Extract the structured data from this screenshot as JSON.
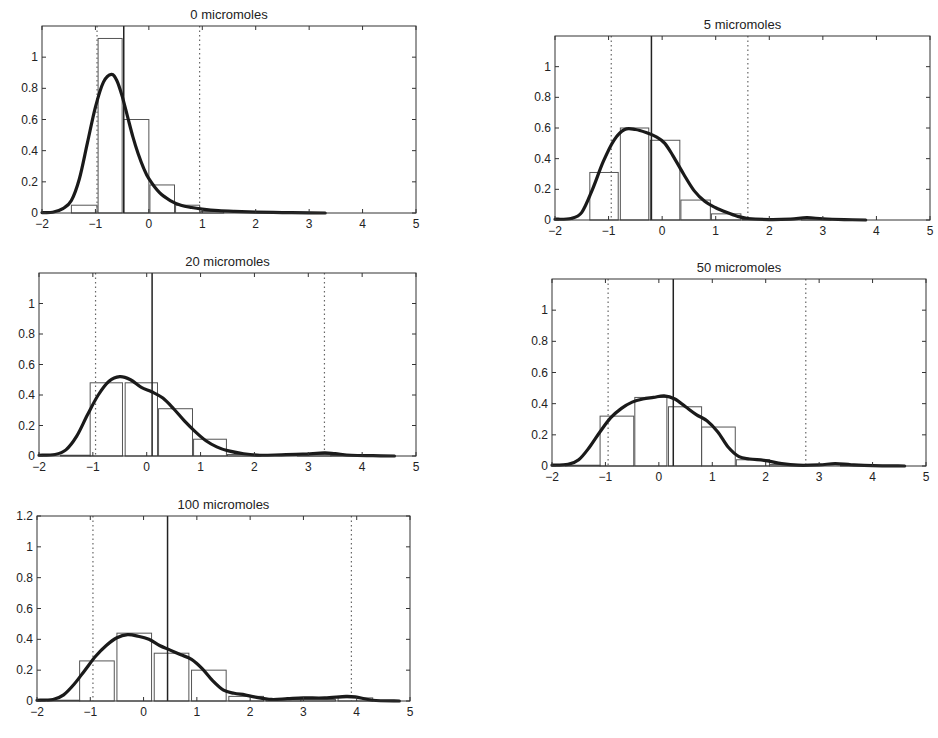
{
  "chart_data": [
    {
      "type": "bar",
      "title": "0 micromoles",
      "xlabel": "",
      "ylabel": "",
      "xlim": [
        -2,
        5
      ],
      "ylim": [
        0,
        1.2
      ],
      "xticks": [
        -2,
        -1,
        0,
        1,
        2,
        3,
        4,
        5
      ],
      "yticks": [
        0,
        0.2,
        0.4,
        0.6,
        0.8,
        1
      ],
      "grid": false,
      "histogram": [
        {
          "x0": -1.45,
          "x1": -0.97,
          "h": 0.05
        },
        {
          "x0": -0.95,
          "x1": -0.5,
          "h": 1.12
        },
        {
          "x0": -0.47,
          "x1": 0.0,
          "h": 0.6
        },
        {
          "x0": 0.02,
          "x1": 0.48,
          "h": 0.18
        },
        {
          "x0": 0.5,
          "x1": 0.95,
          "h": 0.05
        },
        {
          "x0": 0.97,
          "x1": 1.4,
          "h": 0.01
        }
      ],
      "density": [
        [
          -2,
          0.003
        ],
        [
          -1.8,
          0.005
        ],
        [
          -1.6,
          0.03
        ],
        [
          -1.45,
          0.08
        ],
        [
          -1.3,
          0.22
        ],
        [
          -1.15,
          0.45
        ],
        [
          -1.0,
          0.68
        ],
        [
          -0.85,
          0.84
        ],
        [
          -0.7,
          0.89
        ],
        [
          -0.6,
          0.85
        ],
        [
          -0.5,
          0.75
        ],
        [
          -0.4,
          0.62
        ],
        [
          -0.3,
          0.49
        ],
        [
          -0.2,
          0.38
        ],
        [
          -0.1,
          0.29
        ],
        [
          0.0,
          0.22
        ],
        [
          0.2,
          0.13
        ],
        [
          0.4,
          0.08
        ],
        [
          0.6,
          0.05
        ],
        [
          0.8,
          0.035
        ],
        [
          1.0,
          0.025
        ],
        [
          1.3,
          0.015
        ],
        [
          1.6,
          0.01
        ],
        [
          2.0,
          0.006
        ],
        [
          2.5,
          0.003
        ],
        [
          3.0,
          0.001
        ],
        [
          3.3,
          0.0
        ]
      ],
      "median_line": -0.47,
      "dotted_lines": [
        -0.97,
        0.95
      ]
    },
    {
      "type": "bar",
      "title": "5 micromoles",
      "xlabel": "",
      "ylabel": "",
      "xlim": [
        -2,
        5
      ],
      "ylim": [
        0,
        1.2
      ],
      "xticks": [
        -2,
        -1,
        0,
        1,
        2,
        3,
        4,
        5
      ],
      "yticks": [
        0,
        0.2,
        0.4,
        0.6,
        0.8,
        1
      ],
      "grid": false,
      "histogram": [
        {
          "x0": -1.35,
          "x1": -0.82,
          "h": 0.31
        },
        {
          "x0": -0.78,
          "x1": -0.25,
          "h": 0.6
        },
        {
          "x0": -0.22,
          "x1": 0.33,
          "h": 0.52
        },
        {
          "x0": 0.35,
          "x1": 0.9,
          "h": 0.13
        },
        {
          "x0": 0.92,
          "x1": 1.47,
          "h": 0.04
        },
        {
          "x0": 1.5,
          "x1": 2.05,
          "h": 0.005
        },
        {
          "x0": 2.6,
          "x1": 3.15,
          "h": 0.01
        }
      ],
      "density": [
        [
          -2,
          0.005
        ],
        [
          -1.7,
          0.01
        ],
        [
          -1.5,
          0.05
        ],
        [
          -1.3,
          0.2
        ],
        [
          -1.1,
          0.38
        ],
        [
          -0.9,
          0.52
        ],
        [
          -0.7,
          0.59
        ],
        [
          -0.5,
          0.59
        ],
        [
          -0.3,
          0.57
        ],
        [
          -0.1,
          0.54
        ],
        [
          0.05,
          0.5
        ],
        [
          0.2,
          0.42
        ],
        [
          0.4,
          0.3
        ],
        [
          0.6,
          0.19
        ],
        [
          0.8,
          0.12
        ],
        [
          1.0,
          0.08
        ],
        [
          1.2,
          0.05
        ],
        [
          1.4,
          0.025
        ],
        [
          1.6,
          0.01
        ],
        [
          2.0,
          0.003
        ],
        [
          2.4,
          0.006
        ],
        [
          2.7,
          0.015
        ],
        [
          3.0,
          0.008
        ],
        [
          3.4,
          0.003
        ],
        [
          3.8,
          0.0
        ]
      ],
      "median_line": -0.2,
      "dotted_lines": [
        -0.95,
        1.6
      ]
    },
    {
      "type": "bar",
      "title": "20 micromoles",
      "xlabel": "",
      "ylabel": "",
      "xlim": [
        -2,
        5
      ],
      "ylim": [
        0,
        1.2
      ],
      "xticks": [
        -2,
        -1,
        0,
        1,
        2,
        3,
        4,
        5
      ],
      "yticks": [
        0,
        0.2,
        0.4,
        0.6,
        0.8,
        1
      ],
      "grid": false,
      "histogram": [
        {
          "x0": -1.6,
          "x1": -1.05,
          "h": 0.005
        },
        {
          "x0": -1.05,
          "x1": -0.45,
          "h": 0.48
        },
        {
          "x0": -0.4,
          "x1": 0.2,
          "h": 0.48
        },
        {
          "x0": 0.22,
          "x1": 0.85,
          "h": 0.31
        },
        {
          "x0": 0.87,
          "x1": 1.48,
          "h": 0.11
        },
        {
          "x0": 1.5,
          "x1": 2.12,
          "h": 0.01
        },
        {
          "x0": 2.8,
          "x1": 3.42,
          "h": 0.01
        },
        {
          "x0": 3.42,
          "x1": 4.0,
          "h": 0.005
        }
      ],
      "density": [
        [
          -2,
          0.005
        ],
        [
          -1.7,
          0.01
        ],
        [
          -1.5,
          0.04
        ],
        [
          -1.3,
          0.13
        ],
        [
          -1.1,
          0.27
        ],
        [
          -0.9,
          0.4
        ],
        [
          -0.7,
          0.49
        ],
        [
          -0.5,
          0.52
        ],
        [
          -0.3,
          0.5
        ],
        [
          -0.1,
          0.45
        ],
        [
          0.1,
          0.42
        ],
        [
          0.3,
          0.38
        ],
        [
          0.5,
          0.31
        ],
        [
          0.7,
          0.23
        ],
        [
          0.9,
          0.16
        ],
        [
          1.1,
          0.1
        ],
        [
          1.3,
          0.06
        ],
        [
          1.5,
          0.035
        ],
        [
          1.8,
          0.015
        ],
        [
          2.1,
          0.005
        ],
        [
          2.5,
          0.008
        ],
        [
          2.9,
          0.012
        ],
        [
          3.3,
          0.02
        ],
        [
          3.5,
          0.015
        ],
        [
          3.8,
          0.005
        ],
        [
          4.2,
          0.002
        ],
        [
          4.6,
          0.0
        ]
      ],
      "median_line": 0.1,
      "dotted_lines": [
        -0.95,
        3.3
      ]
    },
    {
      "type": "bar",
      "title": "50 micromoles",
      "xlabel": "",
      "ylabel": "",
      "xlim": [
        -2,
        5
      ],
      "ylim": [
        0,
        1.2
      ],
      "xticks": [
        -2,
        -1,
        0,
        1,
        2,
        3,
        4,
        5
      ],
      "yticks": [
        0,
        0.2,
        0.4,
        0.6,
        0.8,
        1
      ],
      "grid": false,
      "histogram": [
        {
          "x0": -1.75,
          "x1": -1.1,
          "h": 0.005
        },
        {
          "x0": -1.1,
          "x1": -0.47,
          "h": 0.32
        },
        {
          "x0": -0.45,
          "x1": 0.15,
          "h": 0.44
        },
        {
          "x0": 0.18,
          "x1": 0.8,
          "h": 0.38
        },
        {
          "x0": 0.8,
          "x1": 1.43,
          "h": 0.25
        },
        {
          "x0": 1.45,
          "x1": 2.07,
          "h": 0.04
        },
        {
          "x0": 2.07,
          "x1": 2.7,
          "h": 0.01
        },
        {
          "x0": 3.4,
          "x1": 4.0,
          "h": 0.005
        }
      ],
      "density": [
        [
          -2,
          0.005
        ],
        [
          -1.7,
          0.01
        ],
        [
          -1.5,
          0.04
        ],
        [
          -1.3,
          0.12
        ],
        [
          -1.1,
          0.22
        ],
        [
          -0.9,
          0.31
        ],
        [
          -0.7,
          0.37
        ],
        [
          -0.5,
          0.41
        ],
        [
          -0.3,
          0.43
        ],
        [
          -0.1,
          0.44
        ],
        [
          0.1,
          0.45
        ],
        [
          0.3,
          0.43
        ],
        [
          0.5,
          0.38
        ],
        [
          0.7,
          0.33
        ],
        [
          0.9,
          0.29
        ],
        [
          1.1,
          0.22
        ],
        [
          1.3,
          0.12
        ],
        [
          1.5,
          0.06
        ],
        [
          1.7,
          0.045
        ],
        [
          2.0,
          0.035
        ],
        [
          2.3,
          0.015
        ],
        [
          2.6,
          0.005
        ],
        [
          3.0,
          0.007
        ],
        [
          3.3,
          0.015
        ],
        [
          3.6,
          0.008
        ],
        [
          4.0,
          0.002
        ],
        [
          4.6,
          0.0
        ]
      ],
      "median_line": 0.27,
      "dotted_lines": [
        -0.95,
        2.75
      ]
    },
    {
      "type": "bar",
      "title": "100 micromoles",
      "xlabel": "",
      "ylabel": "",
      "xlim": [
        -2,
        5
      ],
      "ylim": [
        0,
        1.2
      ],
      "xticks": [
        -2,
        -1,
        0,
        1,
        2,
        3,
        4,
        5
      ],
      "yticks": [
        0,
        0.2,
        0.4,
        0.6,
        0.8,
        1,
        1.2
      ],
      "grid": false,
      "histogram": [
        {
          "x0": -1.8,
          "x1": -1.2,
          "h": 0.005
        },
        {
          "x0": -1.2,
          "x1": -0.55,
          "h": 0.26
        },
        {
          "x0": -0.5,
          "x1": 0.15,
          "h": 0.44
        },
        {
          "x0": 0.2,
          "x1": 0.85,
          "h": 0.31
        },
        {
          "x0": 0.9,
          "x1": 1.55,
          "h": 0.2
        },
        {
          "x0": 1.6,
          "x1": 2.25,
          "h": 0.03
        },
        {
          "x0": 2.3,
          "x1": 2.95,
          "h": 0.01
        },
        {
          "x0": 2.95,
          "x1": 3.6,
          "h": 0.01
        },
        {
          "x0": 3.65,
          "x1": 4.3,
          "h": 0.02
        }
      ],
      "density": [
        [
          -2,
          0.005
        ],
        [
          -1.7,
          0.01
        ],
        [
          -1.5,
          0.04
        ],
        [
          -1.3,
          0.11
        ],
        [
          -1.1,
          0.2
        ],
        [
          -0.9,
          0.29
        ],
        [
          -0.7,
          0.36
        ],
        [
          -0.5,
          0.41
        ],
        [
          -0.3,
          0.43
        ],
        [
          -0.1,
          0.42
        ],
        [
          0.1,
          0.4
        ],
        [
          0.3,
          0.36
        ],
        [
          0.5,
          0.33
        ],
        [
          0.7,
          0.3
        ],
        [
          0.9,
          0.27
        ],
        [
          1.1,
          0.21
        ],
        [
          1.3,
          0.13
        ],
        [
          1.5,
          0.07
        ],
        [
          1.7,
          0.05
        ],
        [
          1.9,
          0.04
        ],
        [
          2.1,
          0.025
        ],
        [
          2.4,
          0.01
        ],
        [
          2.7,
          0.015
        ],
        [
          3.0,
          0.02
        ],
        [
          3.4,
          0.02
        ],
        [
          3.8,
          0.03
        ],
        [
          4.0,
          0.025
        ],
        [
          4.3,
          0.005
        ],
        [
          4.8,
          0.0
        ]
      ],
      "median_line": 0.45,
      "dotted_lines": [
        -0.95,
        3.9
      ]
    }
  ],
  "panels": [
    {
      "title": "0 micromoles",
      "box": {
        "left": 42,
        "top": 26,
        "right": 416,
        "bottom": 213
      }
    },
    {
      "title": "5 micromoles",
      "box": {
        "left": 555,
        "top": 36,
        "right": 930,
        "bottom": 220
      }
    },
    {
      "title": "20 micromoles",
      "box": {
        "left": 39,
        "top": 273,
        "right": 416,
        "bottom": 456
      }
    },
    {
      "title": "50 micromoles",
      "box": {
        "left": 552,
        "top": 279,
        "right": 926,
        "bottom": 466
      }
    },
    {
      "title": "100 micromoles",
      "box": {
        "left": 37,
        "top": 516,
        "right": 410,
        "bottom": 701
      }
    }
  ],
  "colors": {
    "axis": "#333333",
    "density": "#1a1a1a",
    "bar": "#555555",
    "median": "#222222",
    "dotted": "#666666",
    "text": "#222222"
  }
}
